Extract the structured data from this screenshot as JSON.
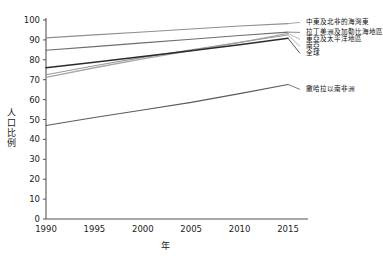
{
  "chart_data": {
    "type": "line",
    "title": "",
    "xlabel": "年",
    "ylabel": "人口比例",
    "x": [
      1990,
      1995,
      2000,
      2005,
      2010,
      2015
    ],
    "xlim": [
      1990,
      2015
    ],
    "ylim": [
      0,
      100
    ],
    "grid": false,
    "legend_position": "right-outside",
    "xticks": [
      "1990",
      "1995",
      "2000",
      "2005",
      "2010",
      "2015"
    ],
    "yticks": [
      "0",
      "10",
      "20",
      "30",
      "40",
      "50",
      "60",
      "70",
      "80",
      "90",
      "100"
    ],
    "series": [
      {
        "name": "中東及北非的海灣東",
        "color": "#8f8f8f",
        "width": 1.1,
        "values": [
          91.0,
          92.5,
          94.0,
          95.5,
          97.0,
          98.2
        ]
      },
      {
        "name": "拉丁美洲及加勒比海地區",
        "color": "#6e6e6e",
        "width": 1.1,
        "values": [
          84.8,
          86.6,
          88.5,
          90.3,
          92.2,
          93.9
        ]
      },
      {
        "name": "東亞及太平洋地區",
        "color": "#a8a8a8",
        "width": 1.3,
        "values": [
          71.2,
          76.0,
          80.5,
          84.6,
          88.6,
          93.3
        ]
      },
      {
        "name": "南亞",
        "color": "#9a9a9a",
        "width": 1.1,
        "values": [
          72.5,
          77.0,
          81.2,
          85.0,
          88.8,
          92.5
        ]
      },
      {
        "name": "全球",
        "color": "#2b2b2b",
        "width": 1.5,
        "values": [
          76.0,
          78.8,
          81.6,
          84.5,
          87.6,
          90.8
        ]
      },
      {
        "name": "撒哈拉以南非洲",
        "color": "#5a5a5a",
        "width": 1.1,
        "values": [
          47.0,
          51.0,
          54.8,
          58.6,
          63.0,
          67.6
        ]
      }
    ]
  },
  "legend": {
    "items": [
      {
        "label": "中東及北非的海灣東"
      },
      {
        "label": "拉丁美洲及加勒比海地區"
      },
      {
        "label": "東亞及太平洋地區"
      },
      {
        "label": "南亞"
      },
      {
        "label": "全球"
      },
      {
        "label": "撒哈拉以南非洲"
      }
    ]
  }
}
